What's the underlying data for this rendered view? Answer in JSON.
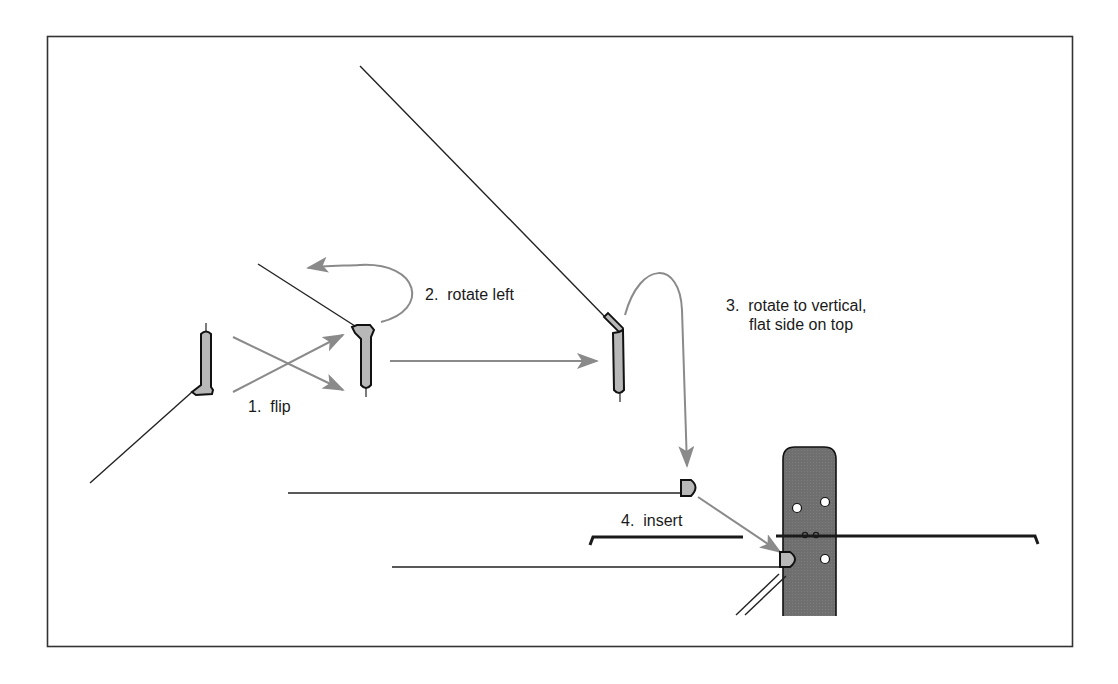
{
  "figure": {
    "frame": {
      "x": 47,
      "y": 36,
      "w": 1025,
      "h": 610,
      "color": "#333333"
    },
    "colors": {
      "line": "#222222",
      "arrow": "#8a8a8a",
      "part_fill": "#b8b8b8",
      "post_fill": "#6f6f6f",
      "hole": "#ffffff",
      "rail": "#1a1a1a"
    }
  },
  "steps": [
    {
      "id": 1,
      "label": "1.  flip",
      "x": 248,
      "y": 398
    },
    {
      "id": 2,
      "label": "2.  rotate left",
      "x": 425,
      "y": 286
    },
    {
      "id": 3,
      "label_line1": "3.  rotate to vertical,",
      "label_line2": "flat side on top",
      "x": 726,
      "y": 297
    },
    {
      "id": 4,
      "label": "4.  insert",
      "x": 621,
      "y": 512
    }
  ],
  "parts": [
    {
      "name": "part-initial",
      "cx": 206,
      "top": 330,
      "bottom": 393
    },
    {
      "name": "part-flipped",
      "cx": 365,
      "top": 325,
      "bottom": 389
    },
    {
      "name": "part-rotated",
      "cx": 620,
      "top": 318,
      "bottom": 395
    },
    {
      "name": "part-vertical-end",
      "cx": 689,
      "cy": 487
    },
    {
      "name": "part-inserted",
      "cx": 787,
      "cy": 559
    }
  ],
  "post": {
    "x": 783,
    "y": 447,
    "w": 53,
    "h": 169,
    "radius": 12
  },
  "holes": [
    {
      "cx": 797,
      "cy": 507
    },
    {
      "cx": 824,
      "cy": 502
    },
    {
      "cx": 824,
      "cy": 559
    }
  ],
  "rail": {
    "left_x1": 590,
    "left_x2": 743,
    "right_x1": 776,
    "right_x2": 1038,
    "y": 536
  }
}
